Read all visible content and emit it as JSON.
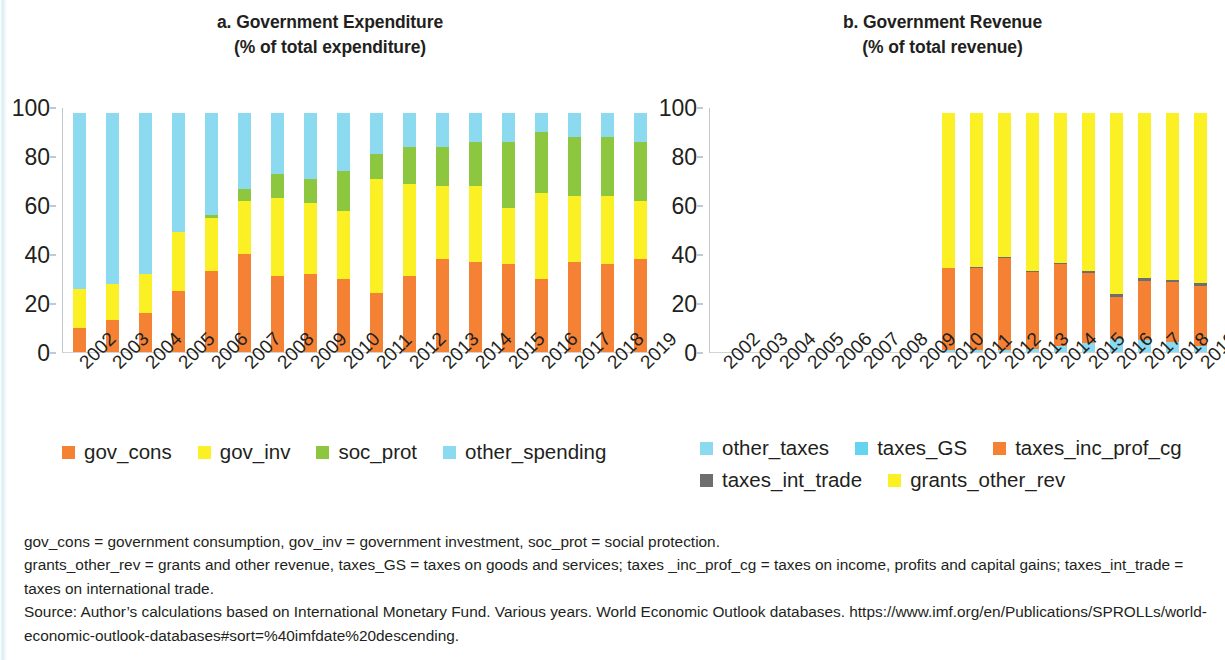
{
  "panel_a": {
    "title_line1": "a. Government Expenditure",
    "title_line2": "(% of total expenditure)"
  },
  "panel_b": {
    "title_line1": "b. Government Revenue",
    "title_line2": "(% of total revenue)"
  },
  "legend_a": [
    {
      "label": "gov_cons",
      "color": "#F58135"
    },
    {
      "label": "gov_inv",
      "color": "#FAF024"
    },
    {
      "label": "soc_prot",
      "color": "#8DC63F"
    },
    {
      "label": "other_spending",
      "color": "#8BDAF0"
    }
  ],
  "legend_b": [
    {
      "label": "other_taxes",
      "color": "#8BDAF0"
    },
    {
      "label": "taxes_GS",
      "color": "#66D4F0"
    },
    {
      "label": "taxes_inc_prof_cg",
      "color": "#F58135"
    },
    {
      "label": "taxes_int_trade",
      "color": "#6D6E70"
    },
    {
      "label": "grants_other_rev",
      "color": "#FAF024"
    }
  ],
  "notes": [
    "gov_cons = government consumption, gov_inv = government investment, soc_prot = social protection.",
    "grants_other_rev = grants and other revenue, taxes_GS = taxes on goods and services; taxes _inc_prof_cg = taxes on income, profits and capital gains; taxes_int_trade = taxes on international trade.",
    "Source: Author’s calculations based on International Monetary Fund. Various years. World Economic Outlook databases. https://www.imf.org/en/Publications/SPROLLs/world-economic-outlook-databases#sort=%40imfdate%20descending."
  ],
  "chart_data": [
    {
      "type": "bar",
      "id": "government-expenditure",
      "stacked": true,
      "title": "a. Government Expenditure (% of total expenditure)",
      "xlabel": "",
      "ylabel": "% of total expenditure",
      "ylim": [
        0,
        100
      ],
      "yticks": [
        0,
        20,
        40,
        60,
        80,
        100
      ],
      "grid": false,
      "legend_position": "bottom",
      "categories": [
        "2002",
        "2003",
        "2004",
        "2005",
        "2006",
        "2007",
        "2008",
        "2009",
        "2010",
        "2011",
        "2012",
        "2013",
        "2014",
        "2015",
        "2016",
        "2017",
        "2018",
        "2019"
      ],
      "series": [
        {
          "name": "gov_cons",
          "color": "#F58135",
          "values": [
            10,
            13,
            16,
            25,
            33,
            40,
            31,
            32,
            30,
            24,
            31,
            38,
            37,
            36,
            30,
            37,
            36,
            38
          ]
        },
        {
          "name": "gov_inv",
          "color": "#FAF024",
          "values": [
            16,
            15,
            16,
            24,
            22,
            22,
            32,
            29,
            28,
            47,
            38,
            30,
            31,
            23,
            35,
            27,
            28,
            24
          ]
        },
        {
          "name": "soc_prot",
          "color": "#8DC63F",
          "values": [
            0,
            0,
            0,
            0,
            1,
            5,
            10,
            10,
            16,
            10,
            15,
            16,
            18,
            27,
            25,
            24,
            24,
            24
          ]
        },
        {
          "name": "other_spending",
          "color": "#8BDAF0",
          "values": [
            72,
            70,
            66,
            49,
            42,
            31,
            25,
            27,
            24,
            17,
            14,
            14,
            12,
            12,
            8,
            10,
            10,
            12
          ]
        }
      ]
    },
    {
      "type": "bar",
      "id": "government-revenue",
      "stacked": true,
      "title": "b. Government Revenue (% of total revenue)",
      "xlabel": "",
      "ylabel": "% of total revenue",
      "ylim": [
        0,
        100
      ],
      "yticks": [
        0,
        20,
        40,
        60,
        80,
        100
      ],
      "grid": false,
      "legend_position": "bottom",
      "categories": [
        "2002",
        "2003",
        "2004",
        "2005",
        "2006",
        "2007",
        "2008",
        "2009",
        "2010",
        "2011",
        "2012",
        "2013",
        "2014",
        "2015",
        "2016",
        "2017",
        "2018",
        "2019"
      ],
      "series": [
        {
          "name": "other_taxes",
          "color": "#8BDAF0",
          "values": [
            0,
            0,
            0,
            0,
            0,
            0,
            0,
            0,
            0.8,
            0.8,
            1.0,
            1.4,
            2.3,
            3.8,
            5.3,
            4.8,
            4.2,
            2.4
          ]
        },
        {
          "name": "taxes_GS",
          "color": "#66D4F0",
          "values": [
            0,
            0,
            0,
            0,
            0,
            0,
            0,
            0,
            0,
            0,
            0,
            0,
            0,
            0,
            0,
            0,
            0,
            0
          ]
        },
        {
          "name": "taxes_inc_prof_cg",
          "color": "#F58135",
          "values": [
            0,
            0,
            0,
            0,
            0,
            0,
            0,
            0,
            33.5,
            33.6,
            37.6,
            31.3,
            33.8,
            28.4,
            17.4,
            24.4,
            24.3,
            24.8
          ]
        },
        {
          "name": "taxes_int_trade",
          "color": "#6D6E70",
          "values": [
            0,
            0,
            0,
            0,
            0,
            0,
            0,
            0,
            0.3,
            0.6,
            0.4,
            0.5,
            0.5,
            1.1,
            1.2,
            1.1,
            1.0,
            1.0
          ]
        },
        {
          "name": "grants_other_rev",
          "color": "#FAF024",
          "values": [
            0,
            0,
            0,
            0,
            0,
            0,
            0,
            0,
            63.4,
            63.0,
            59.0,
            64.8,
            61.4,
            64.7,
            74.1,
            67.7,
            68.5,
            69.8
          ]
        }
      ]
    }
  ]
}
